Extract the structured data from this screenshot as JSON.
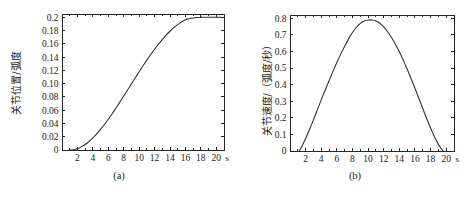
{
  "figure": {
    "background_color": "#ffffff",
    "line_color": "#2b2b2b",
    "axis_color": "#262626"
  },
  "panels": [
    {
      "id": "a",
      "caption": "(a)",
      "ylabel": "关节位置/弧度",
      "xunit": "s"
    },
    {
      "id": "b",
      "caption": "(b)",
      "ylabel": "关节速度/（弧度/秒）",
      "xunit": "s"
    }
  ],
  "chart_data": [
    {
      "type": "line",
      "title": "(a)",
      "xlabel": "s",
      "ylabel": "关节位置/弧度",
      "xlim": [
        0,
        21
      ],
      "ylim": [
        0,
        0.205
      ],
      "grid": false,
      "legend": "none",
      "xticks": [
        2,
        4,
        6,
        8,
        10,
        12,
        14,
        16,
        18,
        20
      ],
      "xticklabels": [
        "2",
        "4",
        "6",
        "8",
        "10",
        "12",
        "14",
        "16",
        "18",
        "20"
      ],
      "yticks": [
        0,
        0.02,
        0.04,
        0.06,
        0.08,
        0.1,
        0.12,
        0.14,
        0.16,
        0.18,
        0.2
      ],
      "yticklabels": [
        "0",
        "0.02",
        "0.04",
        "0.06",
        "0.08",
        "0.10",
        "0.12",
        "0.14",
        "0.16",
        "0.18",
        "0.2"
      ],
      "series": [
        {
          "name": "关节位置",
          "x": [
            1.0,
            1.5,
            2.0,
            2.5,
            3.0,
            3.5,
            4.0,
            4.5,
            5.0,
            5.5,
            6.0,
            6.5,
            7.0,
            7.5,
            8.0,
            8.5,
            9.0,
            9.5,
            10.0,
            10.5,
            11.0,
            11.5,
            12.0,
            12.5,
            13.0,
            13.5,
            14.0,
            14.5,
            15.0,
            15.5,
            16.0,
            16.5,
            17.0,
            17.5,
            18.0,
            18.5,
            19.0,
            19.5,
            20.0,
            20.6
          ],
          "y": [
            0.0,
            0.0005,
            0.0021,
            0.0047,
            0.0083,
            0.0128,
            0.0181,
            0.0242,
            0.031,
            0.0384,
            0.0463,
            0.0546,
            0.0633,
            0.0722,
            0.0813,
            0.0905,
            0.0997,
            0.1089,
            0.118,
            0.1269,
            0.1355,
            0.1439,
            0.1518,
            0.1594,
            0.1665,
            0.173,
            0.179,
            0.1844,
            0.1891,
            0.1931,
            0.1963,
            0.198,
            0.1991,
            0.1997,
            0.1999,
            0.2,
            0.2,
            0.2,
            0.2,
            0.2
          ]
        }
      ]
    },
    {
      "type": "line",
      "title": "(b)",
      "xlabel": "s",
      "ylabel": "关节速度/（弧度/秒）",
      "xlim": [
        0,
        21
      ],
      "ylim": [
        0,
        0.82
      ],
      "grid": false,
      "legend": "none",
      "xticks": [
        2,
        4,
        6,
        8,
        10,
        12,
        14,
        16,
        18,
        20
      ],
      "xticklabels": [
        "2",
        "4",
        "6",
        "8",
        "10",
        "12",
        "14",
        "16",
        "18",
        "20"
      ],
      "yticks": [
        0,
        0.1,
        0.2,
        0.3,
        0.4,
        0.5,
        0.6,
        0.7,
        0.8
      ],
      "yticklabels": [
        "0",
        "0.1",
        "0.2",
        "0.3",
        "0.4",
        "0.5",
        "0.6",
        "0.7",
        "0.8"
      ],
      "series": [
        {
          "name": "关节速度",
          "x": [
            1.2,
            1.6,
            2.0,
            2.5,
            3.0,
            3.5,
            4.0,
            4.5,
            5.0,
            5.5,
            6.0,
            6.5,
            7.0,
            7.5,
            8.0,
            8.5,
            9.0,
            9.5,
            10.0,
            10.5,
            11.0,
            11.5,
            12.0,
            12.5,
            13.0,
            13.5,
            14.0,
            14.5,
            15.0,
            15.5,
            16.0,
            16.5,
            17.0,
            17.5,
            18.0,
            18.5,
            19.0,
            19.4,
            19.6
          ],
          "y": [
            0.0,
            0.035,
            0.075,
            0.13,
            0.188,
            0.248,
            0.308,
            0.366,
            0.424,
            0.48,
            0.534,
            0.584,
            0.632,
            0.676,
            0.714,
            0.746,
            0.77,
            0.784,
            0.79,
            0.79,
            0.784,
            0.77,
            0.748,
            0.719,
            0.684,
            0.644,
            0.598,
            0.548,
            0.494,
            0.437,
            0.378,
            0.318,
            0.256,
            0.196,
            0.139,
            0.086,
            0.04,
            0.012,
            0.0
          ]
        }
      ]
    }
  ]
}
